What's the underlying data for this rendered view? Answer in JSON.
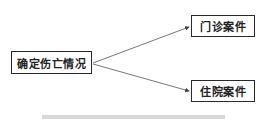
{
  "diagram": {
    "root": {
      "label": "确定伤亡情况"
    },
    "children": [
      {
        "label": "门诊案件"
      },
      {
        "label": "住院案件"
      }
    ],
    "edges": [
      {
        "from": "确定伤亡情况",
        "to": "门诊案件"
      },
      {
        "from": "确定伤亡情况",
        "to": "住院案件"
      }
    ],
    "colors": {
      "line": "#555555",
      "border": "#2a2a2a",
      "bar": "#d8d8d8"
    }
  }
}
